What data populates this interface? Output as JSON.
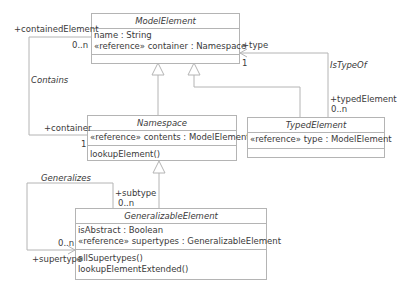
{
  "classes": {
    "model_element": {
      "name": "ModelElement",
      "attributes": [
        "name : String",
        "«reference» container : Namespace"
      ],
      "operations": []
    },
    "namespace": {
      "name": "Namespace",
      "attributes": [
        "«reference» contents : ModelElement"
      ],
      "operations": [
        "lookupElement()"
      ]
    },
    "typed_element": {
      "name": "TypedElement",
      "attributes": [
        "«reference» type : ModelElement"
      ],
      "operations": []
    },
    "generalizable_element": {
      "name": "GeneralizableElement",
      "attributes": [
        "isAbstract : Boolean",
        "«reference» supertypes : GeneralizableElement"
      ],
      "operations": [
        "allSupertypes()",
        "lookupElementExtended()"
      ]
    }
  },
  "associations": {
    "contains": {
      "name": "Contains",
      "end1_role": "+containedElement",
      "end1_mult": "0..n",
      "end2_role": "+container",
      "end2_mult": "1"
    },
    "is_type_of": {
      "name": "IsTypeOf",
      "end1_role": "+type",
      "end1_mult": "1",
      "end2_role": "+typedElement",
      "end2_mult": "0..n"
    },
    "generalizes": {
      "name": "Generalizes",
      "end1_role": "+subtype",
      "end1_mult": "0..n",
      "end2_role": "+supertype",
      "end2_mult": "0..n"
    }
  },
  "colors": {
    "line": "#b4b4b4",
    "text": "#3a3a3a"
  }
}
